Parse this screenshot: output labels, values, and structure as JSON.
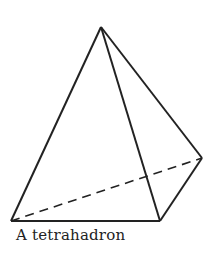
{
  "caption": "A tetrahadron",
  "figure": {
    "shape": "tetrahedron",
    "stroke_color": "#222222",
    "vertices": {
      "apex": [
        101,
        27
      ],
      "bottom_left": [
        11,
        221
      ],
      "bottom_right": [
        160,
        221
      ],
      "right": [
        202,
        158
      ]
    },
    "hidden_edge": "bottom_left-right (dashed)"
  }
}
